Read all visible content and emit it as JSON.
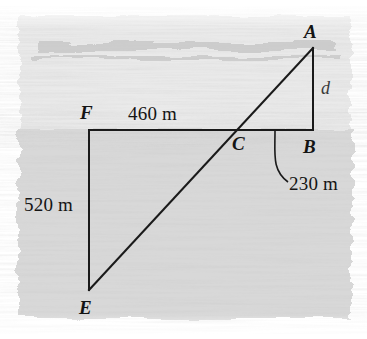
{
  "figure": {
    "canvas": {
      "width": 367,
      "height": 339
    },
    "background": {
      "style": "hand-torn watercolor wash band, sketchy edges",
      "upper_band_color": "#e9e9e9",
      "lower_band_color": "#d6d6d6",
      "paper_color": "#ffffff"
    },
    "line_color": "#1a1a1a",
    "label_color": "#141414",
    "variable_color": "#3a3a3a"
  },
  "labels": {
    "vertex_A": "A",
    "vertex_B": "B",
    "vertex_C": "C",
    "vertex_E": "E",
    "vertex_F": "F",
    "unknown_d": "d"
  },
  "dimensions": {
    "top_horizontal": "460 m",
    "right_vertical_segment": "230 m",
    "left_vertical": "520 m"
  },
  "geometry": {
    "points": {
      "A": {
        "x": 313,
        "y": 48
      },
      "B": {
        "x": 313,
        "y": 130
      },
      "C": {
        "x": 240,
        "y": 130
      },
      "E": {
        "x": 89,
        "y": 290
      },
      "F": {
        "x": 89,
        "y": 130
      }
    },
    "segments": [
      {
        "name": "F-B",
        "from": "F",
        "to": "B"
      },
      {
        "name": "F-E",
        "from": "F",
        "to": "E"
      },
      {
        "name": "A-B",
        "from": "A",
        "to": "B"
      },
      {
        "name": "E-A",
        "from": "E",
        "to": "A"
      }
    ],
    "leader_line": {
      "name": "leader-230m",
      "from": {
        "x": 275,
        "y": 131
      },
      "to": {
        "x": 288,
        "y": 182
      }
    }
  }
}
